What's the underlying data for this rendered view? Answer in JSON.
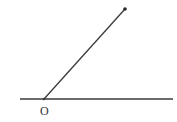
{
  "diagram": {
    "type": "geometry-angle",
    "colors": {
      "stroke": "#3a3a3a",
      "background": "#ffffff"
    },
    "baseline": {
      "x1": 20,
      "y1": 99,
      "x2": 173,
      "y2": 99
    },
    "ray": {
      "x1": 44,
      "y1": 99,
      "x2": 125,
      "y2": 9
    },
    "points": [
      {
        "name": "O",
        "x": 44,
        "y": 99,
        "label": "O",
        "label_x": 40,
        "label_y": 115
      },
      {
        "name": "ray-end",
        "x": 125,
        "y": 9,
        "label": ""
      }
    ]
  }
}
